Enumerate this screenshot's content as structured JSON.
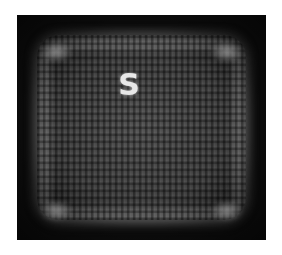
{
  "image": {
    "description": "Grayscale blurry reconstruction of a textured square frame on black background with a bright letter in upper center",
    "glyph": "S",
    "background_color": "#0c0c0c",
    "page_color": "#ffffff"
  }
}
